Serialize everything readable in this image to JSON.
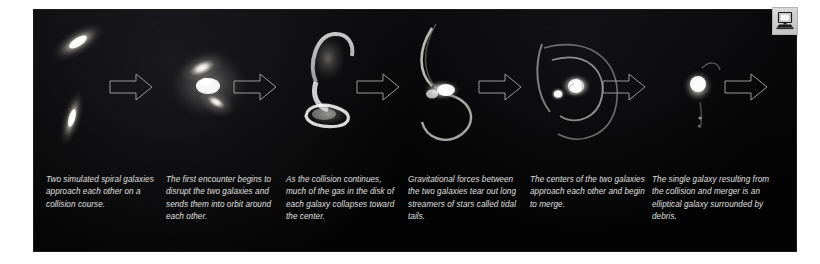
{
  "figure": {
    "panel_background": "#050505",
    "caption_color": "#d4d4d4",
    "arrow_color": "#9a9a9a",
    "stage_count": 6,
    "arrow_count": 6
  },
  "corner": {
    "icon": "computer-monitor-icon",
    "label": "Computer",
    "background": "#d2d2d2"
  },
  "stages": [
    {
      "index": 1,
      "name": "two-spiral-galaxies",
      "alt": "Two separate simulated spiral galaxies, one tilted upper-left and one elongated lower-left",
      "caption": "Two simulated spiral galaxies approach each other on a collision course."
    },
    {
      "index": 2,
      "name": "first-encounter",
      "alt": "The two galaxies overlapping into a bright distorted blob",
      "caption": "The first encounter begins to disrupt the two galaxies and sends them into orbit around each other."
    },
    {
      "index": 3,
      "name": "collision-continues",
      "alt": "An elongated S-shaped merging pair with gas collapsing inward",
      "caption": "As the collision continues, much of the gas in the disk of each galaxy collapses toward the center."
    },
    {
      "index": 4,
      "name": "tidal-tails",
      "alt": "Bright core with two long curving tidal tails of stars",
      "caption": "Gravitational forces between the two galaxies tear out long streamers of stars called tidal tails."
    },
    {
      "index": 5,
      "name": "cores-merging",
      "alt": "Two bright cores close together surrounded by large sweeping shells",
      "caption": "The centers of the two galaxies approach each other and begin to merge."
    },
    {
      "index": 6,
      "name": "elliptical-remnant",
      "alt": "A single compact elliptical galaxy with faint debris around it",
      "caption": "The single galaxy resulting from the collision and merger is an elliptical galaxy surrounded by debris."
    }
  ]
}
